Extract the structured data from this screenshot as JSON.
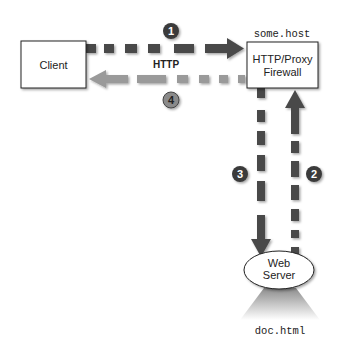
{
  "diagram": {
    "nodes": {
      "client": {
        "label": "Client"
      },
      "proxy": {
        "label_line1": "HTTP/Proxy",
        "label_line2": "Firewall",
        "host": "some.host"
      },
      "web_server": {
        "label_line1": "Web",
        "label_line2": "Server",
        "document": "doc.html"
      }
    },
    "protocol_label": "HTTP",
    "steps": [
      {
        "number": "1",
        "from": "Client",
        "to": "HTTP/Proxy Firewall"
      },
      {
        "number": "2",
        "from": "Web Server",
        "to": "HTTP/Proxy Firewall"
      },
      {
        "number": "3",
        "from": "HTTP/Proxy Firewall",
        "to": "Web Server"
      },
      {
        "number": "4",
        "from": "HTTP/Proxy Firewall",
        "to": "Client"
      }
    ],
    "colors": {
      "dark_arrow": "#4a4a4a",
      "light_arrow": "#9a9a9a",
      "step_circle_dark": "#3a3a3a",
      "step_circle_light": "#8a8a8a"
    }
  }
}
